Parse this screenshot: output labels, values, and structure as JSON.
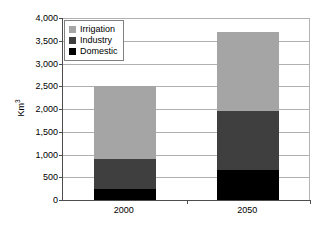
{
  "chart_data": {
    "type": "bar",
    "subtype": "stacked-bar",
    "title": "",
    "xlabel": "",
    "ylabel": "Km3",
    "ylabel_display": "Km³",
    "categories": [
      "2000",
      "2050"
    ],
    "series": [
      {
        "name": "Domestic",
        "values": [
          250,
          650
        ],
        "color": "#000000"
      },
      {
        "name": "Industry",
        "values": [
          650,
          1300
        ],
        "color": "#3f3f3f"
      },
      {
        "name": "Irrigation",
        "values": [
          1600,
          1750
        ],
        "color": "#a5a5a5"
      }
    ],
    "totals": [
      2500,
      3700
    ],
    "ylim": [
      0,
      4000
    ],
    "ytick_values": [
      0,
      500,
      1000,
      1500,
      2000,
      2500,
      3000,
      3500,
      4000
    ],
    "ytick_labels": [
      "0",
      "500",
      "1,000",
      "1,500",
      "2,000",
      "2,500",
      "3,000",
      "3,500",
      "4,000"
    ],
    "grid": {
      "horizontal": true,
      "vertical": false
    },
    "legend": {
      "position": "top-left-inside",
      "entries": [
        {
          "label": "Irrigation",
          "color": "#a5a5a5"
        },
        {
          "label": "Industry",
          "color": "#3f3f3f"
        },
        {
          "label": "Domestic",
          "color": "#000000"
        }
      ]
    },
    "axis_color": "#4d4d4d",
    "gridline_color": "#b0b0b0",
    "background": "#ffffff"
  }
}
